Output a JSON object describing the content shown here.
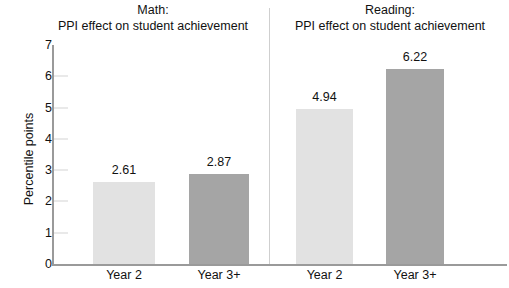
{
  "chart_data": {
    "type": "bar",
    "title": "",
    "ylabel": "Percentile points",
    "xlabel": "",
    "ylim": [
      0,
      7
    ],
    "yticks": [
      "0",
      "1",
      "2",
      "3",
      "4",
      "5",
      "6",
      "7"
    ],
    "grid": "horizontal-ticks",
    "legend": "none",
    "panels": [
      {
        "title_line1": "Math:",
        "title_line2": "PPI effect on student achievement",
        "categories": [
          "Year 2",
          "Year 3+"
        ],
        "values": [
          2.61,
          2.87
        ],
        "value_labels": [
          "2.61",
          "2.87"
        ],
        "colors": [
          "#e2e2e2",
          "#a5a5a5"
        ]
      },
      {
        "title_line1": "Reading:",
        "title_line2": "PPI effect on student achievement",
        "categories": [
          "Year 2",
          "Year 3+"
        ],
        "values": [
          4.94,
          6.22
        ],
        "value_labels": [
          "4.94",
          "6.22"
        ],
        "colors": [
          "#e2e2e2",
          "#a5a5a5"
        ]
      }
    ]
  },
  "colors": {
    "bar_light": "#e2e2e2",
    "bar_dark": "#a5a5a5",
    "axis": "#9a9a9a",
    "gridline": "#d3d3d3",
    "text": "#111111",
    "background": "#ffffff"
  }
}
